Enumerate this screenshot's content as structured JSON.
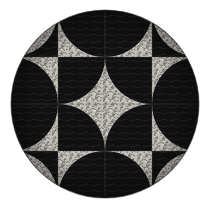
{
  "artwork": {
    "title": "Circular Quilt Medallion",
    "kind": "textile-quilt-photograph",
    "canvas": {
      "width": 211,
      "height": 210,
      "background_color": "#ffffff"
    },
    "medallion": {
      "shape": "circle",
      "center_x": 105,
      "center_y": 104,
      "radius": 94,
      "rim_label": "circular quilt edge"
    },
    "palette": {
      "dark_fabric": "#131313",
      "dark_fabric_shade": "#000000",
      "light_fabric": "#bdbab4",
      "light_fabric_shade": "#8f8c86",
      "light_fabric_highlight": "#e2e0dc",
      "seam_line": "#6e6b66",
      "background": "#ffffff"
    },
    "grid": {
      "columns": 4,
      "rows": 4,
      "block_size": 47,
      "origin_x": 11,
      "origin_y": 10,
      "block_style": "drunkards-path-quarter-circle",
      "symmetry": "4-fold rotational",
      "total_blocks": 16
    },
    "texture": {
      "name": "stipple-quilting",
      "description": "dense meandering stipple stitch on light fabric",
      "dot_count": 420,
      "line_count": 150
    },
    "blocks": [
      {
        "row": 0,
        "col": 0,
        "arc_corner": "br",
        "arc_fill": "dark",
        "ground_fill": "light"
      },
      {
        "row": 0,
        "col": 1,
        "arc_corner": "bl",
        "arc_fill": "light",
        "ground_fill": "dark"
      },
      {
        "row": 0,
        "col": 2,
        "arc_corner": "br",
        "arc_fill": "light",
        "ground_fill": "dark"
      },
      {
        "row": 0,
        "col": 3,
        "arc_corner": "bl",
        "arc_fill": "dark",
        "ground_fill": "light"
      },
      {
        "row": 1,
        "col": 0,
        "arc_corner": "tr",
        "arc_fill": "light",
        "ground_fill": "dark"
      },
      {
        "row": 1,
        "col": 1,
        "arc_corner": "br",
        "arc_fill": "light",
        "ground_fill": "dark"
      },
      {
        "row": 1,
        "col": 2,
        "arc_corner": "bl",
        "arc_fill": "light",
        "ground_fill": "dark"
      },
      {
        "row": 1,
        "col": 3,
        "arc_corner": "tl",
        "arc_fill": "light",
        "ground_fill": "dark"
      },
      {
        "row": 2,
        "col": 0,
        "arc_corner": "br",
        "arc_fill": "light",
        "ground_fill": "dark"
      },
      {
        "row": 2,
        "col": 1,
        "arc_corner": "tr",
        "arc_fill": "light",
        "ground_fill": "dark"
      },
      {
        "row": 2,
        "col": 2,
        "arc_corner": "tl",
        "arc_fill": "light",
        "ground_fill": "dark"
      },
      {
        "row": 2,
        "col": 3,
        "arc_corner": "bl",
        "arc_fill": "light",
        "ground_fill": "dark"
      },
      {
        "row": 3,
        "col": 0,
        "arc_corner": "tr",
        "arc_fill": "dark",
        "ground_fill": "light"
      },
      {
        "row": 3,
        "col": 1,
        "arc_corner": "tl",
        "arc_fill": "light",
        "ground_fill": "dark"
      },
      {
        "row": 3,
        "col": 2,
        "arc_corner": "tr",
        "arc_fill": "light",
        "ground_fill": "dark"
      },
      {
        "row": 3,
        "col": 3,
        "arc_corner": "tl",
        "arc_fill": "dark",
        "ground_fill": "light"
      }
    ],
    "motifs": [
      {
        "name": "center-four-point-star",
        "fill": "light",
        "center_x": 105,
        "center_y": 104
      },
      {
        "name": "inner-pinwheel-petals",
        "count": 4,
        "fill": "light"
      },
      {
        "name": "outer-petal-ring",
        "count": 8,
        "fill": "light"
      },
      {
        "name": "corner-wedges",
        "count": 4,
        "fill": "dark"
      }
    ]
  }
}
